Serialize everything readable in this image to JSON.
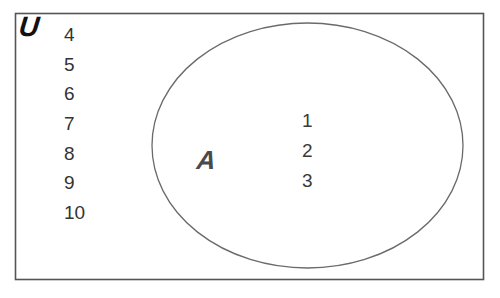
{
  "diagram": {
    "type": "venn",
    "universe": {
      "label": "U",
      "elements_outside": [
        "4",
        "5",
        "6",
        "7",
        "8",
        "9",
        "10"
      ]
    },
    "sets": [
      {
        "label": "A",
        "elements": [
          "1",
          "2",
          "3"
        ]
      }
    ],
    "colors": {
      "border": "#555555",
      "ellipse_stroke": "#666666",
      "text": "#333333",
      "universe_label": "#111111",
      "set_label": "#4a4a4a"
    }
  }
}
